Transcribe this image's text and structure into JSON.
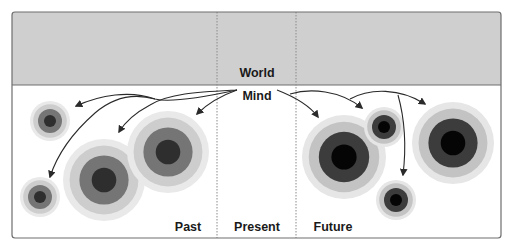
{
  "diagram": {
    "title_world": "World",
    "title_mind": "Mind",
    "columns": {
      "past": "Past",
      "present": "Present",
      "future": "Future"
    },
    "colors": {
      "world_fill": "#cfcfcf",
      "border": "#6e6e6e",
      "divider": "#8a8a8a",
      "arrow": "#2a2a2a",
      "ring_past": [
        "#e9e9e9",
        "#cdcdcd",
        "#757575",
        "#2e2e2e"
      ],
      "ring_future": [
        "#e6e6e6",
        "#c3c3c3",
        "#3c3c3c",
        "#050505"
      ]
    },
    "circles": [
      {
        "id": "past-small-top",
        "group": "past",
        "size": "small"
      },
      {
        "id": "past-small-bottom",
        "group": "past",
        "size": "small"
      },
      {
        "id": "past-large-left",
        "group": "past",
        "size": "large"
      },
      {
        "id": "past-large-right",
        "group": "past",
        "size": "large"
      },
      {
        "id": "future-large-left",
        "group": "future",
        "size": "large"
      },
      {
        "id": "future-small-top",
        "group": "future",
        "size": "small"
      },
      {
        "id": "future-small-bottom",
        "group": "future",
        "size": "small"
      },
      {
        "id": "future-large-right",
        "group": "future",
        "size": "large"
      }
    ],
    "arrows": [
      {
        "id": "arrow-to-past-small-top",
        "target": "past-small-top"
      },
      {
        "id": "arrow-to-past-small-bottom",
        "target": "past-small-bottom"
      },
      {
        "id": "arrow-to-past-large-left",
        "target": "past-large-left"
      },
      {
        "id": "arrow-to-past-large-right",
        "target": "past-large-right"
      },
      {
        "id": "arrow-to-future-large-left",
        "target": "future-large-left"
      },
      {
        "id": "arrow-to-future-small-top",
        "target": "future-small-top"
      },
      {
        "id": "arrow-to-future-large-right",
        "target": "future-large-right"
      },
      {
        "id": "arrow-to-future-small-bottom",
        "target": "future-small-bottom"
      }
    ]
  }
}
